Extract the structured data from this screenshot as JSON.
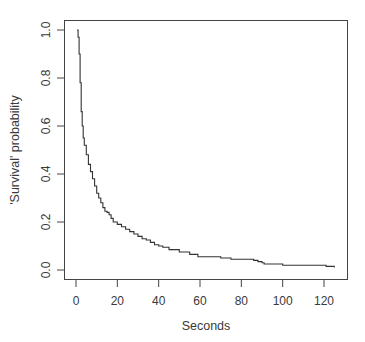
{
  "chart_data": {
    "type": "line",
    "subtype": "step",
    "title": "",
    "xlabel": "Seconds",
    "ylabel": "'Survival' probability",
    "xlim": [
      0,
      128
    ],
    "ylim": [
      0,
      1.0
    ],
    "xticks": [
      0,
      20,
      40,
      60,
      80,
      100,
      120
    ],
    "xtick_labels": [
      "0",
      "20",
      "40",
      "60",
      "80",
      "100",
      "120"
    ],
    "yticks": [
      0.0,
      0.2,
      0.4,
      0.6,
      0.8,
      1.0
    ],
    "ytick_labels": [
      "0.0",
      "0.2",
      "0.4",
      "0.6",
      "0.8",
      "1.0"
    ],
    "grid": false,
    "legend": null,
    "series": [
      {
        "name": "survival",
        "color": "#333333",
        "x": [
          0.5,
          1,
          1.5,
          2,
          2.5,
          3,
          3.5,
          4,
          5,
          6,
          7,
          8,
          9,
          10,
          11,
          12,
          13,
          14,
          15,
          16,
          17,
          18,
          20,
          22,
          24,
          26,
          28,
          30,
          32,
          34,
          36,
          38,
          40,
          42,
          45,
          50,
          55,
          59,
          65,
          70,
          75,
          80,
          86,
          88,
          90,
          91,
          95,
          100,
          110,
          119,
          121,
          125
        ],
        "y": [
          1.0,
          0.97,
          0.9,
          0.78,
          0.66,
          0.6,
          0.55,
          0.52,
          0.48,
          0.44,
          0.41,
          0.38,
          0.35,
          0.32,
          0.3,
          0.28,
          0.26,
          0.245,
          0.24,
          0.23,
          0.215,
          0.2,
          0.19,
          0.18,
          0.17,
          0.16,
          0.15,
          0.14,
          0.13,
          0.125,
          0.115,
          0.105,
          0.1,
          0.095,
          0.085,
          0.075,
          0.065,
          0.055,
          0.055,
          0.05,
          0.045,
          0.045,
          0.04,
          0.035,
          0.03,
          0.025,
          0.025,
          0.02,
          0.02,
          0.02,
          0.015,
          0.01
        ]
      }
    ]
  },
  "labels": {
    "xlabel": "Seconds",
    "ylabel": "'Survival' probability"
  }
}
